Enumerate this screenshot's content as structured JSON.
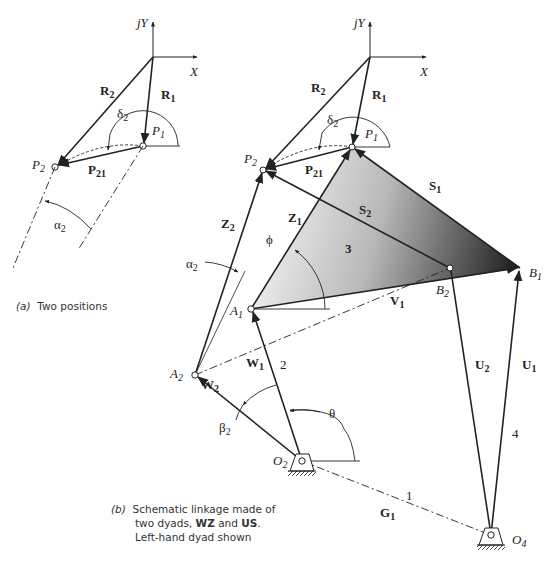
{
  "figure_a": {
    "caption_tag": "(a)",
    "caption_text": "Two positions",
    "axis_y": "jY",
    "axis_x": "X",
    "labels": {
      "R2": "R",
      "R2_sub": "2",
      "R1": "R",
      "R1_sub": "1",
      "delta2": "δ",
      "delta2_sub": "2",
      "P1": "P",
      "P1_sub": "1",
      "P2": "P",
      "P2_sub": "2",
      "P21": "P",
      "P21_sub": "21",
      "alpha2": "α",
      "alpha2_sub": "2"
    }
  },
  "figure_b": {
    "caption_tag": "(b)",
    "caption_line1": "Schematic linkage made of",
    "caption_line2_pre": "two dyads, ",
    "caption_line2_b1": "WZ",
    "caption_line2_mid": " and ",
    "caption_line2_b2": "US",
    "caption_line2_post": ".",
    "caption_line3": "Left-hand dyad shown",
    "axis_y": "jY",
    "axis_x": "X",
    "labels": {
      "R2": "R",
      "R2_sub": "2",
      "R1": "R",
      "R1_sub": "1",
      "delta2": "δ",
      "delta2_sub": "2",
      "P1": "P",
      "P1_sub": "1",
      "P2": "P",
      "P2_sub": "2",
      "P21": "P",
      "P21_sub": "21",
      "S1": "S",
      "S1_sub": "1",
      "S2": "S",
      "S2_sub": "2",
      "Z1": "Z",
      "Z1_sub": "1",
      "Z2": "Z",
      "Z2_sub": "2",
      "phi": "ϕ",
      "link3": "3",
      "alpha2": "α",
      "alpha2_sub": "2",
      "A1": "A",
      "A1_sub": "1",
      "A2": "A",
      "A2_sub": "2",
      "B1": "B",
      "B1_sub": "1",
      "B2": "B",
      "B2_sub": "2",
      "V1": "V",
      "V1_sub": "1",
      "W1": "W",
      "W1_sub": "1",
      "W2": "W",
      "W2_sub": "2",
      "link2": "2",
      "U1": "U",
      "U1_sub": "1",
      "U2": "U",
      "U2_sub": "2",
      "link4": "4",
      "theta": "θ",
      "beta2": "β",
      "beta2_sub": "2",
      "O2": "O",
      "O2_sub": "2",
      "O4": "O",
      "O4_sub": "4",
      "link1": "1",
      "G1": "G",
      "G1_sub": "1"
    }
  },
  "colors": {
    "ink": "#222222",
    "triangle_light": "#f2f2f2",
    "triangle_dark": "#1a1a1a"
  }
}
